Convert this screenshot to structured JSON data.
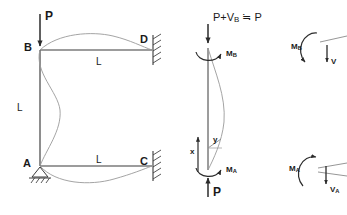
{
  "diagram": {
    "title_present": false,
    "stroke_color": "#3a3a3a",
    "deflection_color": "#8a8a8a",
    "text_color": "#1a1a1a",
    "frame": {
      "name": "portal-frame-sidesway",
      "nodes": [
        {
          "id": "B",
          "label": "B",
          "x": 40,
          "y": 50,
          "support": "none"
        },
        {
          "id": "D",
          "label": "D",
          "x": 152,
          "y": 50,
          "support": "fixed-right"
        },
        {
          "id": "A",
          "label": "A",
          "x": 40,
          "y": 166,
          "support": "pinned"
        },
        {
          "id": "C",
          "label": "C",
          "x": 152,
          "y": 166,
          "support": "fixed-right"
        }
      ],
      "members": [
        {
          "name": "beam-BD",
          "from": "B",
          "to": "D",
          "length_label": "L"
        },
        {
          "name": "beam-AC",
          "from": "A",
          "to": "C",
          "length_label": "L"
        },
        {
          "name": "column-AB",
          "from": "A",
          "to": "B",
          "length_label": "L"
        }
      ],
      "length_labels": [
        {
          "name": "length-label-top",
          "text": "L",
          "x": 99,
          "y": 57
        },
        {
          "name": "length-label-bottom",
          "text": "L",
          "x": 99,
          "y": 160
        },
        {
          "name": "length-label-column",
          "text": "L",
          "x": 17,
          "y": 102
        }
      ],
      "load": {
        "name": "applied-load-P",
        "label": "P",
        "x": 40,
        "y_start": 14,
        "y_end": 48,
        "direction": "down",
        "label_x": 45,
        "label_y": 12
      }
    },
    "free_body_column": {
      "name": "column-free-body",
      "top_force_label": "P+V",
      "top_force_sub": "B",
      "top_force_approx": "≒",
      "top_force_equiv": "P",
      "bottom_force_label": "P",
      "moment_top_label": "M",
      "moment_top_sub": "B",
      "moment_bottom_label": "M",
      "moment_bottom_sub": "A",
      "axis_x_label": "x",
      "axis_y_label": "y",
      "top_y": 48,
      "bottom_y": 170,
      "center_x": 208
    },
    "joint_free_bodies": [
      {
        "name": "joint-B-free-body",
        "moment_label": "M",
        "moment_sub": "B",
        "shear_label": "V",
        "shear_sub": "",
        "center_x": 312,
        "center_y": 50
      },
      {
        "name": "joint-A-free-body",
        "moment_label": "M",
        "moment_sub": "A",
        "shear_label": "V",
        "shear_sub": "A",
        "center_x": 312,
        "center_y": 172
      }
    ]
  }
}
